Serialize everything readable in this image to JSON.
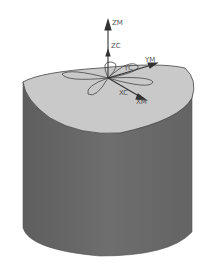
{
  "scene": {
    "colors": {
      "background": "#ffffff",
      "top_surface": "#c9c9c9",
      "cylinder_side": "#6b6b6b",
      "cylinder_shadow": "#5a5a5a",
      "curve": "#444444",
      "axis": "#333333",
      "label": "#555555"
    },
    "axes": {
      "zm": "ZM",
      "zc": "ZC",
      "ym": "YM",
      "yc": "YC",
      "xc": "XC",
      "xm": "XM"
    },
    "objects": [
      {
        "name": "cylinder-body",
        "icon": "cylinder"
      },
      {
        "name": "curved-top-surface",
        "icon": "surface"
      },
      {
        "name": "rose-curve",
        "icon": "four-petal-curve"
      },
      {
        "name": "coordinate-triad",
        "icon": "axes"
      }
    ]
  }
}
